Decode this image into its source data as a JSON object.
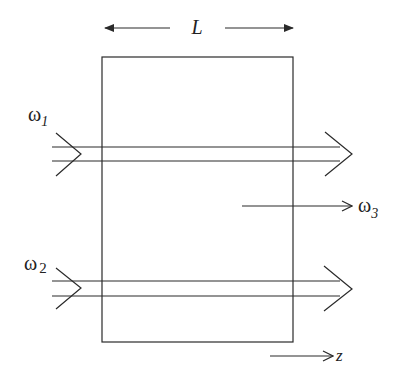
{
  "diagram": {
    "type": "nonlinear-optics-frequency-mixing",
    "length_label": "L",
    "inputs": [
      {
        "label": "ω",
        "subscript": "1"
      },
      {
        "label": "ω",
        "subscript": "2"
      }
    ],
    "output": {
      "label": "ω",
      "subscript": "3"
    },
    "axis": {
      "label": "z"
    }
  },
  "colors": {
    "stroke": "#2a2a2a",
    "background": "#ffffff"
  }
}
